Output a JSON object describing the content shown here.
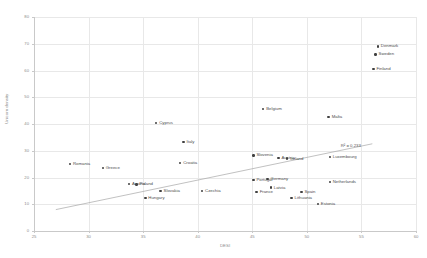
{
  "chart_data": {
    "type": "scatter",
    "title": "",
    "xlabel": "DESI",
    "ylabel": "Unicorn density",
    "xlim": [
      25,
      60
    ],
    "ylim": [
      0,
      80
    ],
    "xticks": [
      25,
      30,
      35,
      40,
      45,
      50,
      55,
      60
    ],
    "yticks": [
      0,
      10,
      20,
      30,
      40,
      50,
      60,
      70,
      80
    ],
    "grid": true,
    "legend": "none",
    "annotations": [
      {
        "text": "R² = 0.233",
        "x": 53.1,
        "y": 33.0
      }
    ],
    "trendline": {
      "type": "linear",
      "r_squared": 0.233,
      "x_start": 27.0,
      "y_start": 8.0,
      "x_end": 56.0,
      "y_end": 32.6
    },
    "points": [
      {
        "label": "Denmark",
        "x": 56.5,
        "y": 69.0
      },
      {
        "label": "Sweden",
        "x": 56.3,
        "y": 66.0
      },
      {
        "label": "Finland",
        "x": 56.1,
        "y": 60.6
      },
      {
        "label": "Belgium",
        "x": 46.0,
        "y": 45.6
      },
      {
        "label": "Malta",
        "x": 52.0,
        "y": 42.6
      },
      {
        "label": "Cyprus",
        "x": 36.2,
        "y": 40.4
      },
      {
        "label": "Luxembourg",
        "x": 52.1,
        "y": 27.7
      },
      {
        "label": "Italy",
        "x": 38.7,
        "y": 33.3
      },
      {
        "label": "Slovenia",
        "x": 45.1,
        "y": 28.3
      },
      {
        "label": "Austria",
        "x": 47.4,
        "y": 27.2
      },
      {
        "label": "Ireland",
        "x": 48.2,
        "y": 27.1
      },
      {
        "label": "Croatia",
        "x": 38.4,
        "y": 25.4
      },
      {
        "label": "Romania",
        "x": 28.3,
        "y": 25.0
      },
      {
        "label": "Greece",
        "x": 31.3,
        "y": 23.6
      },
      {
        "label": "Portugal",
        "x": 45.1,
        "y": 19.0
      },
      {
        "label": "Germany",
        "x": 46.4,
        "y": 19.4
      },
      {
        "label": "Netherlands",
        "x": 52.1,
        "y": 18.3
      },
      {
        "label": "Poland",
        "x": 34.4,
        "y": 17.4
      },
      {
        "label": "Austria2",
        "x": 33.7,
        "y": 17.6
      },
      {
        "label": "Latvia",
        "x": 46.7,
        "y": 16.2
      },
      {
        "label": "France",
        "x": 45.4,
        "y": 14.6
      },
      {
        "label": "Slovakia",
        "x": 36.6,
        "y": 15.0
      },
      {
        "label": "Czechia",
        "x": 40.4,
        "y": 15.0
      },
      {
        "label": "Spain",
        "x": 49.5,
        "y": 14.6
      },
      {
        "label": "Hungary",
        "x": 35.2,
        "y": 12.3
      },
      {
        "label": "Lithuania",
        "x": 48.6,
        "y": 12.3
      },
      {
        "label": "Estonia",
        "x": 51.0,
        "y": 10.2
      }
    ]
  },
  "axes": {
    "x_title": "DESI",
    "y_title": "Unicorn density"
  },
  "r2_label": "R² = 0.233"
}
